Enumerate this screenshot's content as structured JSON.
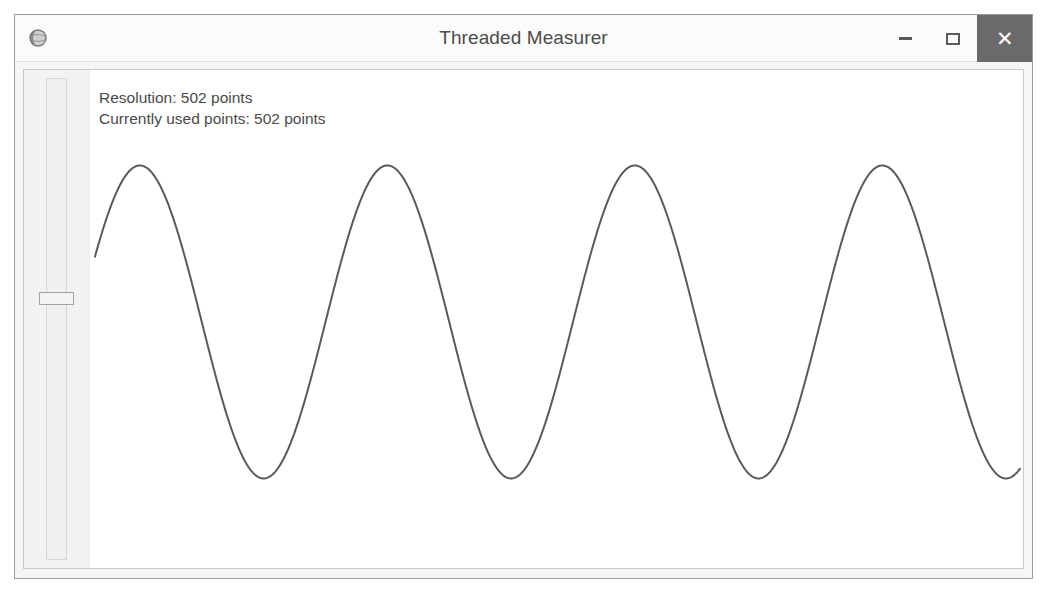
{
  "window": {
    "title": "Threaded Measurer",
    "app_icon": "globe-icon",
    "controls": {
      "minimize_label": "–",
      "maximize_label": "□",
      "close_label": "✕",
      "close_bg": "#6a6a6a"
    }
  },
  "readout": {
    "resolution": "Resolution: 502 points",
    "currently_used": "Currently used points: 502 points"
  },
  "slider": {
    "name": "resolution-slider",
    "orientation": "vertical",
    "thumb_position_percent": 44.5
  },
  "chart_data": {
    "type": "line",
    "title": "",
    "xlabel": "",
    "ylabel": "",
    "grid": false,
    "legend": null,
    "series": [
      {
        "name": "measured-signal",
        "color": "#5a5a5a",
        "line_width": 2,
        "waveform": "sine",
        "points": 502,
        "amplitude_px": 159,
        "center_y_px": 319,
        "period_px": 248,
        "first_peak_x_px": 133,
        "start_x_px": 88,
        "end_x_px": 1015,
        "start_y_px": 258,
        "peak_y_px": 160,
        "trough_y_px": 478,
        "peaks_x_px": [
          133,
          382,
          630,
          878
        ],
        "troughs_x_px": [
          257,
          505,
          753,
          1001
        ]
      }
    ],
    "xlim": [
      0,
      927
    ],
    "ylim": [
      -1,
      1
    ]
  }
}
